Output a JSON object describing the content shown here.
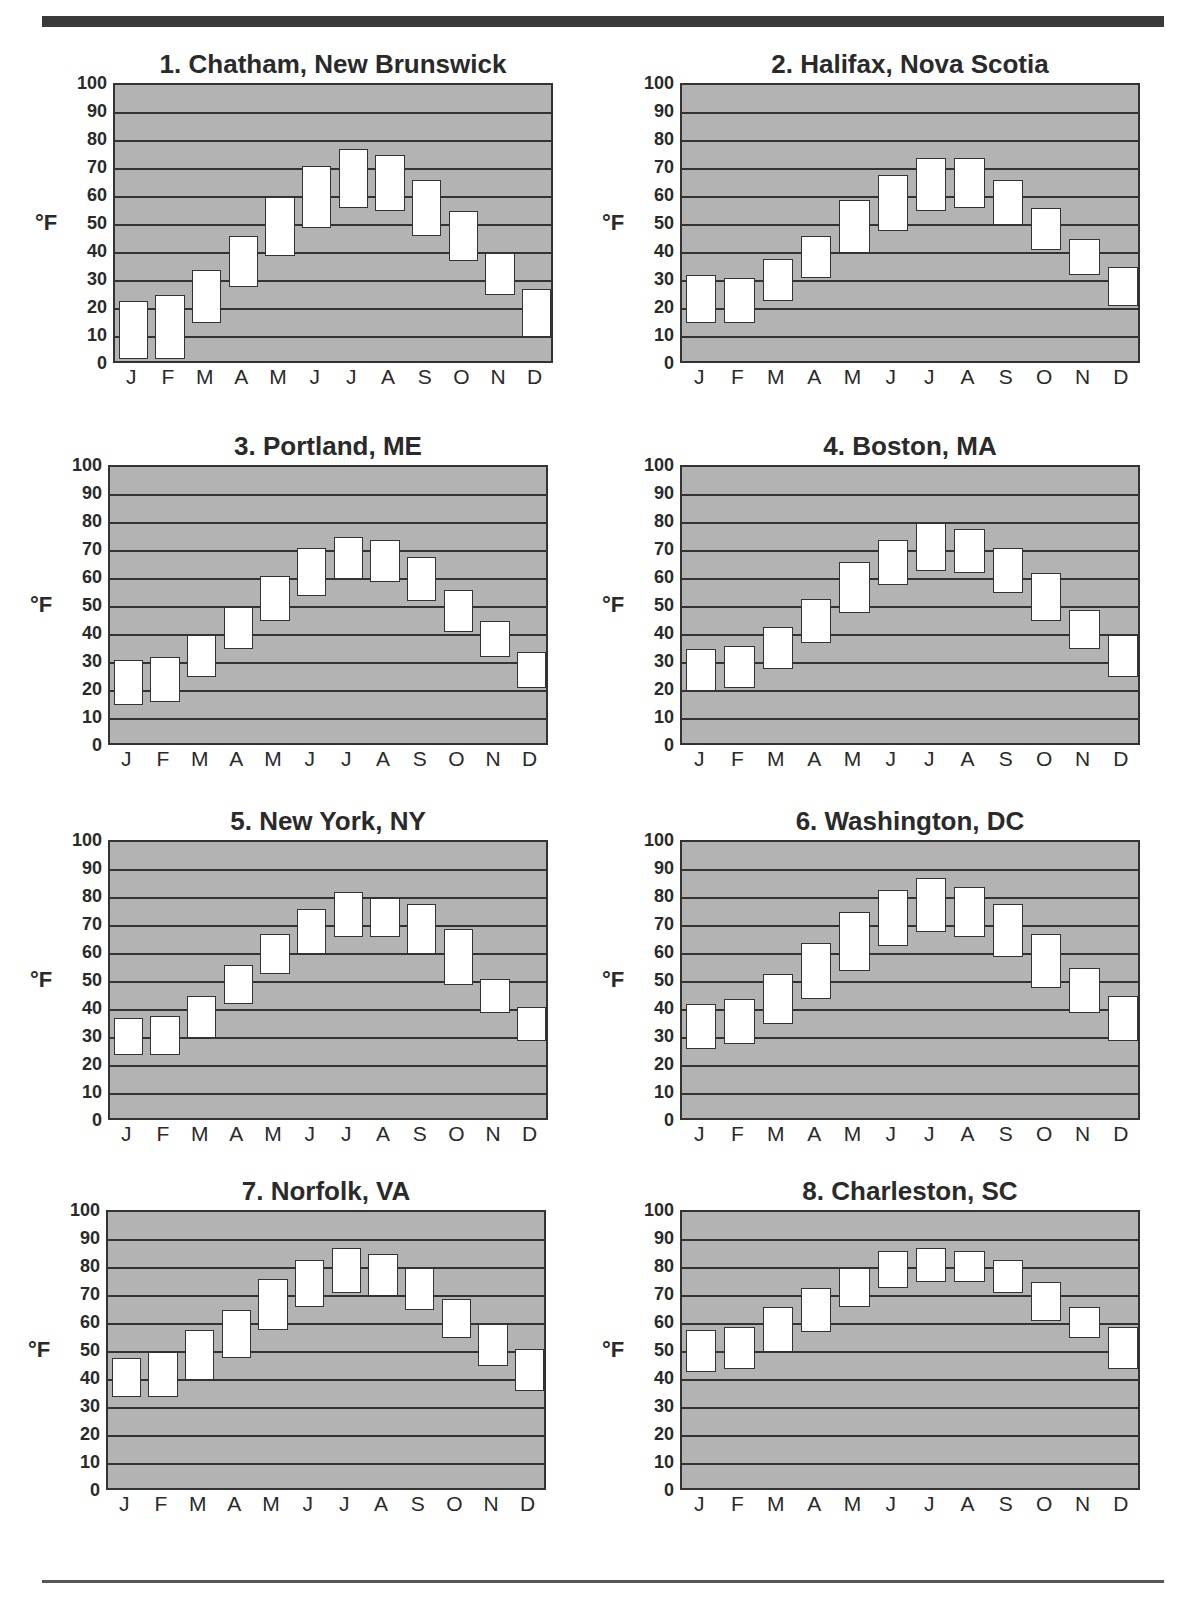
{
  "page": {
    "top_bar_partial_text": "pp"
  },
  "chart_data": [
    {
      "type": "bar",
      "subtype": "floating-range",
      "title": "1. Chatham, New Brunswick",
      "ylabel": "°F",
      "xlabel": "",
      "ylim": [
        0,
        100
      ],
      "yticks": [
        0,
        10,
        20,
        30,
        40,
        50,
        60,
        70,
        80,
        90,
        100
      ],
      "grid": true,
      "categories": [
        "J",
        "F",
        "M",
        "A",
        "M",
        "J",
        "J",
        "A",
        "S",
        "O",
        "N",
        "D"
      ],
      "series": [
        {
          "name": "low",
          "values": [
            2,
            2,
            15,
            28,
            39,
            49,
            56,
            55,
            46,
            37,
            25,
            10
          ]
        },
        {
          "name": "high",
          "values": [
            23,
            25,
            34,
            46,
            60,
            71,
            77,
            75,
            66,
            55,
            40,
            27
          ]
        }
      ]
    },
    {
      "type": "bar",
      "subtype": "floating-range",
      "title": "2. Halifax, Nova Scotia",
      "ylabel": "°F",
      "xlabel": "",
      "ylim": [
        0,
        100
      ],
      "yticks": [
        0,
        10,
        20,
        30,
        40,
        50,
        60,
        70,
        80,
        90,
        100
      ],
      "grid": true,
      "categories": [
        "J",
        "F",
        "M",
        "A",
        "M",
        "J",
        "J",
        "A",
        "S",
        "O",
        "N",
        "D"
      ],
      "series": [
        {
          "name": "low",
          "values": [
            15,
            15,
            23,
            31,
            40,
            48,
            55,
            56,
            50,
            41,
            32,
            21
          ]
        },
        {
          "name": "high",
          "values": [
            32,
            31,
            38,
            46,
            59,
            68,
            74,
            74,
            66,
            56,
            45,
            35
          ]
        }
      ]
    },
    {
      "type": "bar",
      "subtype": "floating-range",
      "title": "3. Portland, ME",
      "ylabel": "°F",
      "xlabel": "",
      "ylim": [
        0,
        100
      ],
      "yticks": [
        0,
        10,
        20,
        30,
        40,
        50,
        60,
        70,
        80,
        90,
        100
      ],
      "grid": true,
      "categories": [
        "J",
        "F",
        "M",
        "A",
        "M",
        "J",
        "J",
        "A",
        "S",
        "O",
        "N",
        "D"
      ],
      "series": [
        {
          "name": "low",
          "values": [
            15,
            16,
            25,
            35,
            45,
            54,
            60,
            59,
            52,
            41,
            32,
            21
          ]
        },
        {
          "name": "high",
          "values": [
            31,
            32,
            40,
            50,
            61,
            71,
            75,
            74,
            68,
            56,
            45,
            34
          ]
        }
      ]
    },
    {
      "type": "bar",
      "subtype": "floating-range",
      "title": "4. Boston, MA",
      "ylabel": "°F",
      "xlabel": "",
      "ylim": [
        0,
        100
      ],
      "yticks": [
        0,
        10,
        20,
        30,
        40,
        50,
        60,
        70,
        80,
        90,
        100
      ],
      "grid": true,
      "categories": [
        "J",
        "F",
        "M",
        "A",
        "M",
        "J",
        "J",
        "A",
        "S",
        "O",
        "N",
        "D"
      ],
      "series": [
        {
          "name": "low",
          "values": [
            20,
            21,
            28,
            37,
            48,
            58,
            63,
            62,
            55,
            45,
            35,
            25
          ]
        },
        {
          "name": "high",
          "values": [
            35,
            36,
            43,
            53,
            66,
            74,
            80,
            78,
            71,
            62,
            49,
            40
          ]
        }
      ]
    },
    {
      "type": "bar",
      "subtype": "floating-range",
      "title": "5. New York, NY",
      "ylabel": "°F",
      "xlabel": "",
      "ylim": [
        0,
        100
      ],
      "yticks": [
        0,
        10,
        20,
        30,
        40,
        50,
        60,
        70,
        80,
        90,
        100
      ],
      "grid": true,
      "categories": [
        "J",
        "F",
        "M",
        "A",
        "M",
        "J",
        "J",
        "A",
        "S",
        "O",
        "N",
        "D"
      ],
      "series": [
        {
          "name": "low",
          "values": [
            24,
            24,
            30,
            42,
            53,
            60,
            66,
            66,
            60,
            49,
            39,
            29
          ]
        },
        {
          "name": "high",
          "values": [
            37,
            38,
            45,
            56,
            67,
            76,
            82,
            80,
            78,
            69,
            51,
            41
          ]
        }
      ]
    },
    {
      "type": "bar",
      "subtype": "floating-range",
      "title": "6. Washington, DC",
      "ylabel": "°F",
      "xlabel": "",
      "ylim": [
        0,
        100
      ],
      "yticks": [
        0,
        10,
        20,
        30,
        40,
        50,
        60,
        70,
        80,
        90,
        100
      ],
      "grid": true,
      "categories": [
        "J",
        "F",
        "M",
        "A",
        "M",
        "J",
        "J",
        "A",
        "S",
        "O",
        "N",
        "D"
      ],
      "series": [
        {
          "name": "low",
          "values": [
            26,
            28,
            35,
            44,
            54,
            63,
            68,
            66,
            59,
            48,
            39,
            29
          ]
        },
        {
          "name": "high",
          "values": [
            42,
            44,
            53,
            64,
            75,
            83,
            87,
            84,
            78,
            67,
            55,
            45
          ]
        }
      ]
    },
    {
      "type": "bar",
      "subtype": "floating-range",
      "title": "7. Norfolk, VA",
      "ylabel": "°F",
      "xlabel": "",
      "ylim": [
        0,
        100
      ],
      "yticks": [
        0,
        10,
        20,
        30,
        40,
        50,
        60,
        70,
        80,
        90,
        100
      ],
      "grid": true,
      "categories": [
        "J",
        "F",
        "M",
        "A",
        "M",
        "J",
        "J",
        "A",
        "S",
        "O",
        "N",
        "D"
      ],
      "series": [
        {
          "name": "low",
          "values": [
            34,
            34,
            40,
            48,
            58,
            66,
            71,
            70,
            65,
            55,
            45,
            36
          ]
        },
        {
          "name": "high",
          "values": [
            48,
            50,
            58,
            65,
            76,
            83,
            87,
            85,
            80,
            69,
            60,
            51
          ]
        }
      ]
    },
    {
      "type": "bar",
      "subtype": "floating-range",
      "title": "8. Charleston, SC",
      "ylabel": "°F",
      "xlabel": "",
      "ylim": [
        0,
        100
      ],
      "yticks": [
        0,
        10,
        20,
        30,
        40,
        50,
        60,
        70,
        80,
        90,
        100
      ],
      "grid": true,
      "categories": [
        "J",
        "F",
        "M",
        "A",
        "M",
        "J",
        "J",
        "A",
        "S",
        "O",
        "N",
        "D"
      ],
      "series": [
        {
          "name": "low",
          "values": [
            43,
            44,
            50,
            57,
            66,
            73,
            75,
            75,
            71,
            61,
            55,
            44
          ]
        },
        {
          "name": "high",
          "values": [
            58,
            59,
            66,
            73,
            80,
            86,
            87,
            86,
            83,
            75,
            66,
            59
          ]
        }
      ]
    }
  ],
  "layout": {
    "positions": [
      {
        "left": 40,
        "top": 45,
        "plotLeft": 73,
        "plotTop": 38,
        "plotW": 440,
        "plotH": 280
      },
      {
        "left": 600,
        "top": 45,
        "plotLeft": 80,
        "plotTop": 38,
        "plotW": 460,
        "plotH": 280
      },
      {
        "left": 40,
        "top": 420,
        "plotLeft": 68,
        "plotTop": 45,
        "plotW": 440,
        "plotH": 280
      },
      {
        "left": 600,
        "top": 420,
        "plotLeft": 80,
        "plotTop": 45,
        "plotW": 460,
        "plotH": 280
      },
      {
        "left": 40,
        "top": 800,
        "plotLeft": 68,
        "plotTop": 40,
        "plotW": 440,
        "plotH": 280
      },
      {
        "left": 600,
        "top": 800,
        "plotLeft": 80,
        "plotTop": 40,
        "plotW": 460,
        "plotH": 280
      },
      {
        "left": 40,
        "top": 1170,
        "plotLeft": 66,
        "plotTop": 40,
        "plotW": 440,
        "plotH": 280
      },
      {
        "left": 600,
        "top": 1170,
        "plotLeft": 80,
        "plotTop": 40,
        "plotW": 460,
        "plotH": 280
      }
    ]
  }
}
